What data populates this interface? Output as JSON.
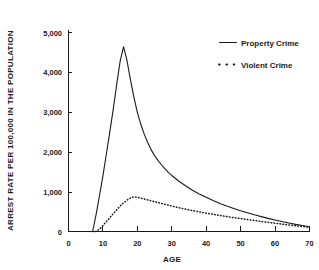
{
  "chart_data": {
    "type": "line",
    "title": "",
    "xlabel": "AGE",
    "ylabel": "ARREST RATE PER 100,000  IN THE POPULATION",
    "xlim": [
      0,
      70
    ],
    "ylim": [
      0,
      5000
    ],
    "xticks": [
      0,
      10,
      20,
      30,
      40,
      50,
      60,
      70
    ],
    "xticklabels": [
      "0",
      "10",
      "20",
      "30",
      "40",
      "50",
      "60",
      "70"
    ],
    "yticks": [
      0,
      1000,
      2000,
      3000,
      4000,
      5000
    ],
    "yticklabels": [
      "0",
      "1,000",
      "2,000",
      "3,000",
      "4,000",
      "5,000"
    ],
    "grid": false,
    "legend_position": "top-right",
    "x": [
      7,
      8,
      9,
      10,
      11,
      12,
      13,
      14,
      15,
      16,
      17,
      18,
      19,
      20,
      21,
      22,
      23,
      24,
      25,
      26,
      27,
      28,
      29,
      30,
      32,
      34,
      36,
      38,
      40,
      42,
      44,
      46,
      48,
      50,
      52,
      54,
      56,
      58,
      60,
      62,
      64,
      66,
      68,
      70
    ],
    "series": [
      {
        "name": "Property Crime",
        "style": "solid",
        "color": "#1a1a1a",
        "peak_age": 16,
        "peak_value": 4650,
        "values": [
          0,
          420,
          900,
          1400,
          1950,
          2500,
          3080,
          3700,
          4280,
          4650,
          4300,
          3820,
          3380,
          3000,
          2700,
          2450,
          2240,
          2060,
          1910,
          1790,
          1680,
          1580,
          1490,
          1410,
          1270,
          1150,
          1040,
          945,
          860,
          780,
          705,
          640,
          580,
          520,
          470,
          420,
          375,
          330,
          290,
          250,
          215,
          180,
          150,
          120
        ]
      },
      {
        "name": "Violent Crime",
        "style": "dotted",
        "color": "#1a1a1a",
        "peak_age": 19,
        "peak_value": 870,
        "values": [
          0,
          0,
          60,
          150,
          250,
          350,
          450,
          545,
          640,
          720,
          790,
          845,
          870,
          860,
          840,
          818,
          795,
          772,
          750,
          728,
          706,
          684,
          662,
          640,
          600,
          562,
          527,
          494,
          462,
          432,
          403,
          376,
          350,
          325,
          300,
          276,
          253,
          230,
          208,
          186,
          165,
          144,
          124,
          105
        ]
      }
    ]
  },
  "legend": {
    "entries": [
      {
        "label": "Property Crime",
        "marker": "solid-line-swatch"
      },
      {
        "label": "Violent Crime",
        "marker": "dotted-line-swatch"
      }
    ]
  }
}
